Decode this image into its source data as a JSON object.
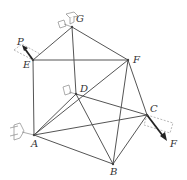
{
  "figure": {
    "type": "space truss",
    "nodes": [
      {
        "id": "G",
        "label": "G",
        "x": 72,
        "y": 27,
        "label_x": 76,
        "label_y": 22,
        "support": true
      },
      {
        "id": "E",
        "label": "E",
        "x": 33,
        "y": 60,
        "label_x": 23,
        "label_y": 68,
        "support": false
      },
      {
        "id": "F",
        "label": "F",
        "x": 128,
        "y": 60,
        "label_x": 133,
        "label_y": 63,
        "support": false
      },
      {
        "id": "D",
        "label": "D",
        "x": 76,
        "y": 94,
        "label_x": 80,
        "label_y": 92,
        "support": true
      },
      {
        "id": "A",
        "label": "A",
        "x": 34,
        "y": 135,
        "label_x": 31,
        "label_y": 147,
        "support": true
      },
      {
        "id": "C",
        "label": "C",
        "x": 147,
        "y": 115,
        "label_x": 150,
        "label_y": 112,
        "support": false
      },
      {
        "id": "B",
        "label": "B",
        "x": 113,
        "y": 164,
        "label_x": 110,
        "label_y": 175,
        "support": false
      }
    ],
    "members": [
      [
        "G",
        "E"
      ],
      [
        "G",
        "F"
      ],
      [
        "G",
        "D"
      ],
      [
        "E",
        "F"
      ],
      [
        "E",
        "A"
      ],
      [
        "A",
        "D"
      ],
      [
        "A",
        "F"
      ],
      [
        "A",
        "B"
      ],
      [
        "A",
        "C"
      ],
      [
        "D",
        "C"
      ],
      [
        "D",
        "B"
      ],
      [
        "F",
        "B"
      ],
      [
        "F",
        "C"
      ],
      [
        "B",
        "C"
      ]
    ],
    "loads": [
      {
        "label": "P",
        "at": "E",
        "direction": "up-left",
        "label_x": 17,
        "label_y": 45
      },
      {
        "label": "F",
        "at": "C",
        "direction": "down-right",
        "label_x": 170,
        "label_y": 147
      }
    ],
    "colors": {
      "member": "#555555",
      "label": "#333333",
      "load": "#222222",
      "guide": "#999999"
    }
  }
}
